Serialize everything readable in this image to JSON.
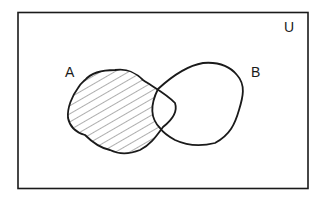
{
  "diagram": {
    "type": "venn",
    "title": "",
    "universe_label": "U",
    "sets": [
      {
        "name": "A",
        "label": "A"
      },
      {
        "name": "B",
        "label": "B"
      }
    ],
    "shaded_region": "A − B",
    "shading_style": "diagonal hatching",
    "colors": {
      "stroke": "#1a1a1a",
      "background": "#ffffff",
      "hatch": "#333333"
    }
  }
}
